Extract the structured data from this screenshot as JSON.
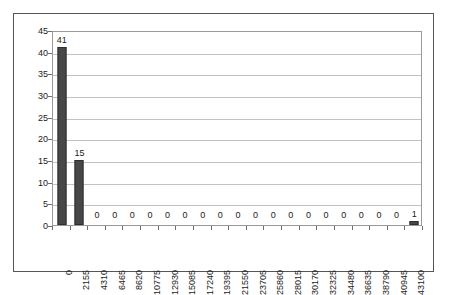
{
  "chart_data": {
    "type": "bar",
    "title": "",
    "subtitle": "",
    "xlabel": "",
    "ylabel": "",
    "categories": [
      "0",
      "2155",
      "4310",
      "6465",
      "8620",
      "10775",
      "12930",
      "15085",
      "17240",
      "19395",
      "21550",
      "23705",
      "25860",
      "28015",
      "30170",
      "32325",
      "34480",
      "36635",
      "38790",
      "40945",
      "43100"
    ],
    "values": [
      41,
      15,
      0,
      0,
      0,
      0,
      0,
      0,
      0,
      0,
      0,
      0,
      0,
      0,
      0,
      0,
      0,
      0,
      0,
      0,
      1
    ],
    "data_labels": [
      "41",
      "15",
      "0",
      "0",
      "0",
      "0",
      "0",
      "0",
      "0",
      "0",
      "0",
      "0",
      "0",
      "0",
      "0",
      "0",
      "0",
      "0",
      "0",
      "0",
      "1"
    ],
    "ylim": [
      0,
      45
    ],
    "yticks": [
      "0",
      "5",
      "10",
      "15",
      "20",
      "25",
      "30",
      "35",
      "40",
      "45"
    ],
    "ytick_values": [
      0,
      5,
      10,
      15,
      20,
      25,
      30,
      35,
      40,
      45
    ],
    "grid": "horizontal",
    "legend": "none",
    "bar_color": "#474747",
    "bar_border_color": "#2e2e2e",
    "gridline_color": "#c2c2c2",
    "plot_border_color": "#9a9a9a",
    "frame_border_color": "#555555",
    "axis_text_color": "#1a1a1a",
    "xtick_rotation": "-90"
  }
}
